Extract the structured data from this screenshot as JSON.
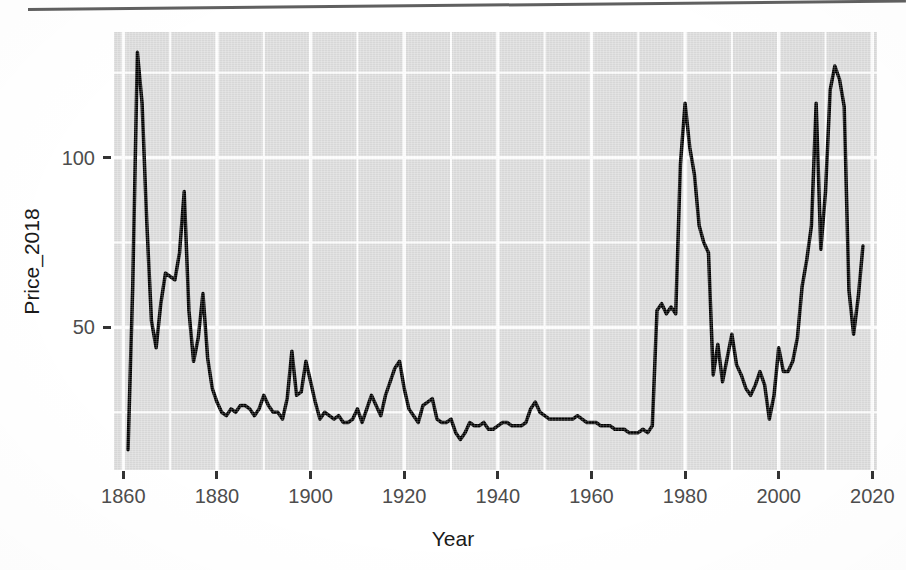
{
  "figure": {
    "background_color": "#ffffff",
    "panel_background_color": "#dcdcdc",
    "gridline_color": "#ffffff",
    "line_color": "#000000",
    "axis_text_color": "#4d4d4d",
    "axis_title_color": "#1a1a1a",
    "page_rule": "scan-page-edge-rule"
  },
  "axes": {
    "x_title": "Year",
    "y_title": "Price_2018",
    "x_ticks": [
      "1860",
      "1880",
      "1900",
      "1920",
      "1940",
      "1960",
      "1980",
      "2000",
      "2020"
    ],
    "y_ticks": [
      "50",
      "100"
    ]
  },
  "chart_data": {
    "type": "line",
    "title": "",
    "subtitle": "",
    "xlabel": "Year",
    "ylabel": "Price_2018",
    "xlim": [
      1858,
      2021
    ],
    "ylim": [
      8,
      137
    ],
    "x_ticks": [
      1860,
      1880,
      1900,
      1920,
      1940,
      1960,
      1980,
      2000,
      2020
    ],
    "y_ticks": [
      50,
      100
    ],
    "x_minor_gridlines": [
      1870,
      1890,
      1910,
      1930,
      1950,
      1970,
      1990,
      2010
    ],
    "y_minor_gridlines": [
      25,
      75,
      125
    ],
    "grid": true,
    "legend": "none",
    "series": [
      {
        "name": "Price_2018",
        "x": [
          1861,
          1862,
          1863,
          1864,
          1865,
          1866,
          1867,
          1868,
          1869,
          1870,
          1871,
          1872,
          1873,
          1874,
          1875,
          1876,
          1877,
          1878,
          1879,
          1880,
          1881,
          1882,
          1883,
          1884,
          1885,
          1886,
          1887,
          1888,
          1889,
          1890,
          1891,
          1892,
          1893,
          1894,
          1895,
          1896,
          1897,
          1898,
          1899,
          1900,
          1901,
          1902,
          1903,
          1904,
          1905,
          1906,
          1907,
          1908,
          1909,
          1910,
          1911,
          1912,
          1913,
          1914,
          1915,
          1916,
          1917,
          1918,
          1919,
          1920,
          1921,
          1922,
          1923,
          1924,
          1925,
          1926,
          1927,
          1928,
          1929,
          1930,
          1931,
          1932,
          1933,
          1934,
          1935,
          1936,
          1937,
          1938,
          1939,
          1940,
          1941,
          1942,
          1943,
          1944,
          1945,
          1946,
          1947,
          1948,
          1949,
          1950,
          1951,
          1952,
          1953,
          1954,
          1955,
          1956,
          1957,
          1958,
          1959,
          1960,
          1961,
          1962,
          1963,
          1964,
          1965,
          1966,
          1967,
          1968,
          1969,
          1970,
          1971,
          1972,
          1973,
          1974,
          1975,
          1976,
          1977,
          1978,
          1979,
          1980,
          1981,
          1982,
          1983,
          1984,
          1985,
          1986,
          1987,
          1988,
          1989,
          1990,
          1991,
          1992,
          1993,
          1994,
          1995,
          1996,
          1997,
          1998,
          1999,
          2000,
          2001,
          2002,
          2003,
          2004,
          2005,
          2006,
          2007,
          2008,
          2009,
          2010,
          2011,
          2012,
          2013,
          2014,
          2015,
          2016,
          2017,
          2018
        ],
        "y": [
          14,
          62,
          131,
          116,
          81,
          52,
          44,
          57,
          66,
          65,
          64,
          72,
          90,
          55,
          40,
          47,
          60,
          41,
          32,
          28,
          25,
          24,
          26,
          25,
          27,
          27,
          26,
          24,
          26,
          30,
          27,
          25,
          25,
          23,
          29,
          43,
          30,
          31,
          40,
          34,
          28,
          23,
          25,
          24,
          23,
          24,
          22,
          22,
          23,
          26,
          22,
          26,
          30,
          27,
          24,
          30,
          34,
          38,
          40,
          32,
          26,
          24,
          22,
          27,
          28,
          29,
          23,
          22,
          22,
          23,
          19,
          17,
          19,
          22,
          21,
          21,
          22,
          20,
          20,
          21,
          22,
          22,
          21,
          21,
          21,
          22,
          26,
          28,
          25,
          24,
          23,
          23,
          23,
          23,
          23,
          23,
          24,
          23,
          22,
          22,
          22,
          21,
          21,
          21,
          20,
          20,
          20,
          19,
          19,
          19,
          20,
          19,
          21,
          55,
          57,
          54,
          56,
          54,
          98,
          116,
          103,
          95,
          80,
          75,
          72,
          36,
          45,
          34,
          41,
          48,
          39,
          36,
          32,
          30,
          33,
          37,
          33,
          23,
          30,
          44,
          37,
          37,
          40,
          47,
          62,
          70,
          80,
          116,
          73,
          90,
          120,
          127,
          123,
          115,
          61,
          48,
          59,
          74
        ]
      }
    ]
  }
}
